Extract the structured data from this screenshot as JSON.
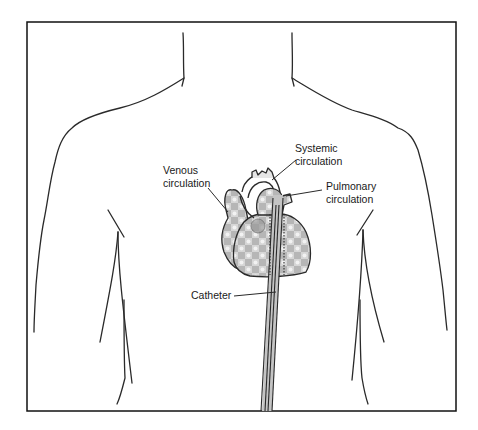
{
  "diagram": {
    "type": "anatomical-illustration",
    "colors": {
      "line": "#2a2a2a",
      "frame": "#111111",
      "shading": "#b8b8b8",
      "background": "#ffffff"
    },
    "labels": {
      "systemic": {
        "line1": "Systemic",
        "line2": "circulation"
      },
      "venous": {
        "line1": "Venous",
        "line2": "circulation"
      },
      "pulmonary": {
        "line1": "Pulmonary",
        "line2": "circulation"
      },
      "catheter": {
        "line1": "Catheter"
      }
    }
  }
}
